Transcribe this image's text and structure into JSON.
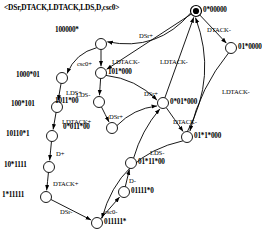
{
  "title": "<DSr,DTACK,LDTACK,LDS,D,csc0>",
  "diagram": {
    "type": "state-transition-graph",
    "stroke_color": "#000000",
    "background": "#ffffff",
    "node_radius": 5.5,
    "nodes": [
      {
        "id": "n0",
        "label": "0*00000",
        "cx": 196,
        "cy": 11,
        "initial": true,
        "label_x": 203,
        "label_y": 6
      },
      {
        "id": "n1",
        "label": "01*0000",
        "cx": 231,
        "cy": 48,
        "initial": false,
        "label_x": 238,
        "label_y": 43
      },
      {
        "id": "n2",
        "label": "100000*",
        "cx": 101,
        "cy": 44,
        "initial": false,
        "label_x": 55,
        "label_y": 26
      },
      {
        "id": "n3",
        "label": "101*000",
        "cx": 101,
        "cy": 73,
        "initial": false,
        "label_x": 108,
        "label_y": 68
      },
      {
        "id": "n4",
        "label": "1000*01",
        "cx": 62,
        "cy": 78,
        "initial": false,
        "label_x": 16,
        "label_y": 71
      },
      {
        "id": "n5",
        "label": "100*101",
        "cx": 57,
        "cy": 107,
        "initial": false,
        "label_x": 11,
        "label_y": 100
      },
      {
        "id": "n6",
        "label": "1011*00",
        "cx": 99,
        "cy": 102,
        "initial": false,
        "label_x": 55,
        "label_y": 97
      },
      {
        "id": "n7",
        "label": "0*011*00",
        "cx": 112,
        "cy": 128,
        "initial": false,
        "label_x": 63,
        "label_y": 123
      },
      {
        "id": "n8",
        "label": "10110*1",
        "cx": 52,
        "cy": 136,
        "initial": false,
        "label_x": 6,
        "label_y": 130
      },
      {
        "id": "n9",
        "label": "10*1111",
        "cx": 49,
        "cy": 167,
        "initial": false,
        "label_x": 4,
        "label_y": 161
      },
      {
        "id": "n10",
        "label": "1*11111",
        "cx": 46,
        "cy": 197,
        "initial": false,
        "label_x": 2,
        "label_y": 191
      },
      {
        "id": "n11",
        "label": "011111*",
        "cx": 97,
        "cy": 223,
        "initial": false,
        "label_x": 104,
        "label_y": 218
      },
      {
        "id": "n12",
        "label": "01111*0",
        "cx": 124,
        "cy": 192,
        "initial": false,
        "label_x": 131,
        "label_y": 187
      },
      {
        "id": "n13",
        "label": "01*11*00",
        "cx": 131,
        "cy": 163,
        "initial": false,
        "label_x": 138,
        "label_y": 158
      },
      {
        "id": "n14",
        "label": "0*01*000",
        "cx": 163,
        "cy": 103,
        "initial": false,
        "label_x": 170,
        "label_y": 98
      },
      {
        "id": "n15",
        "label": "01*1*000",
        "cx": 187,
        "cy": 137,
        "initial": false,
        "label_x": 194,
        "label_y": 132
      }
    ],
    "edges": [
      {
        "from": "n0",
        "to": "n1",
        "label": "DTACK-",
        "label_x": 207,
        "label_y": 26
      },
      {
        "from": "n1",
        "to": "n15",
        "label": "LDTACK-",
        "label_x": 222,
        "label_y": 88
      },
      {
        "from": "n0",
        "to": "n2",
        "label": "DSr+",
        "label_x": 139,
        "label_y": 32
      },
      {
        "from": "n2",
        "to": "n3",
        "label": "csc0+",
        "label_x": 77,
        "label_y": 60
      },
      {
        "from": "n0",
        "to": "n3",
        "label": "LDTACK-",
        "label_x": 112,
        "label_y": 58
      },
      {
        "from": "n2",
        "to": "n4",
        "label": "",
        "label_x": 0,
        "label_y": 0
      },
      {
        "from": "n4",
        "to": "n5",
        "label": "LDS+",
        "label_x": 66,
        "label_y": 89
      },
      {
        "from": "n3",
        "to": "n6",
        "label": "LDS-",
        "label_x": 76,
        "label_y": 91
      },
      {
        "from": "n5",
        "to": "n8",
        "label": "LDTACK+",
        "label_x": 62,
        "label_y": 118
      },
      {
        "from": "n6",
        "to": "n7",
        "label": "DSr+",
        "label_x": 109,
        "label_y": 113
      },
      {
        "from": "n8",
        "to": "n9",
        "label": "D+",
        "label_x": 56,
        "label_y": 150
      },
      {
        "from": "n9",
        "to": "n10",
        "label": "DTACK+",
        "label_x": 53,
        "label_y": 180
      },
      {
        "from": "n10",
        "to": "n11",
        "label": "DSr-",
        "label_x": 60,
        "label_y": 208
      },
      {
        "from": "n11",
        "to": "n12",
        "label": "csc0-",
        "label_x": 104,
        "label_y": 208
      },
      {
        "from": "n12",
        "to": "n13",
        "label": "D-",
        "label_x": 129,
        "label_y": 177
      },
      {
        "from": "n13",
        "to": "n14",
        "label": "",
        "label_x": 0,
        "label_y": 0
      },
      {
        "from": "n7",
        "to": "n14",
        "label": "",
        "label_x": 0,
        "label_y": 0
      },
      {
        "from": "n3",
        "to": "n14",
        "label": "DSr+",
        "label_x": 144,
        "label_y": 90
      },
      {
        "from": "n14",
        "to": "n15",
        "label": "DTACK-",
        "label_x": 173,
        "label_y": 118
      },
      {
        "from": "n15",
        "to": "n11",
        "label": "LDS-",
        "label_x": 150,
        "label_y": 149
      },
      {
        "from": "n15",
        "to": "n0",
        "label": "",
        "label_x": 0,
        "label_y": 0
      },
      {
        "from": "n14",
        "to": "n0",
        "label": "LDTACK-",
        "label_x": 160,
        "label_y": 58
      }
    ]
  }
}
